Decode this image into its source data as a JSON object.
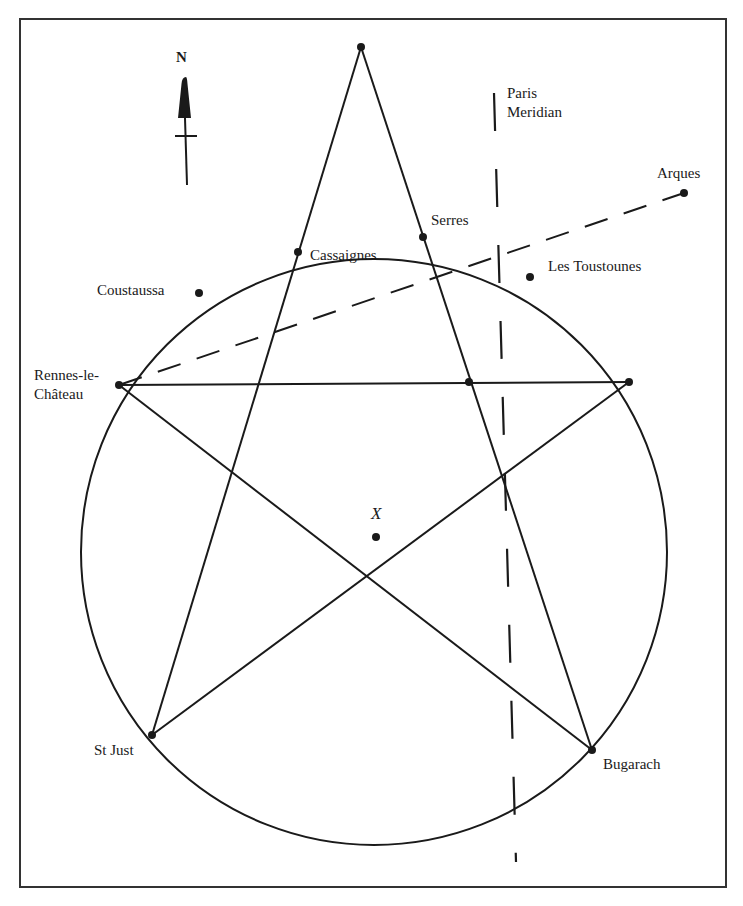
{
  "map": {
    "north_label": "N",
    "meridian_label_line1": "Paris",
    "meridian_label_line2": "Meridian",
    "center_marker_label": "X",
    "colors": {
      "ink": "#1a1a1a",
      "frame": "#333333",
      "background": "#ffffff"
    },
    "places": [
      {
        "name": "Serres"
      },
      {
        "name": "Cassaignes"
      },
      {
        "name": "Coustaussa"
      },
      {
        "name": "Les Toustounes"
      },
      {
        "name": "Arques"
      },
      {
        "name_line1": "Rennes-le-",
        "name_line2": "Château"
      },
      {
        "name": "St Just"
      },
      {
        "name": "Bugarach"
      }
    ]
  }
}
